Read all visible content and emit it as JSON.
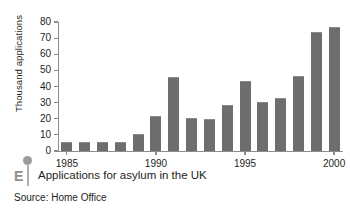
{
  "figure": {
    "marker_letter": "E",
    "caption": "Applications for asylum in the UK",
    "source": "Source: Home Office"
  },
  "chart_data": {
    "type": "bar",
    "title": "Applications for asylum in the UK",
    "subtitle": "Source: Home Office",
    "xlabel": "",
    "ylabel": "Thousand applications",
    "categories": [
      "1985",
      "1986",
      "1987",
      "1988",
      "1989",
      "1990",
      "1991",
      "1992",
      "1993",
      "1994",
      "1995",
      "1996",
      "1997",
      "1998",
      "1999",
      "2000"
    ],
    "values": [
      5,
      5,
      5,
      5,
      10,
      21,
      45,
      20,
      19,
      28,
      43,
      30,
      32,
      46,
      73,
      76
    ],
    "x_tick_labels": [
      "1985",
      "1990",
      "1995",
      "2000"
    ],
    "x_tick_categories": [
      "1985",
      "1990",
      "1995",
      "2000"
    ],
    "y_tick_labels": [
      "0",
      "10",
      "20",
      "30",
      "40",
      "50",
      "60",
      "70",
      "80"
    ],
    "ylim": [
      0,
      80
    ],
    "y_step": 10,
    "grid": false,
    "legend": false,
    "bar_color": "#6e6e6e",
    "axis_color": "#8d8d8d",
    "text_color": "#231f20"
  }
}
